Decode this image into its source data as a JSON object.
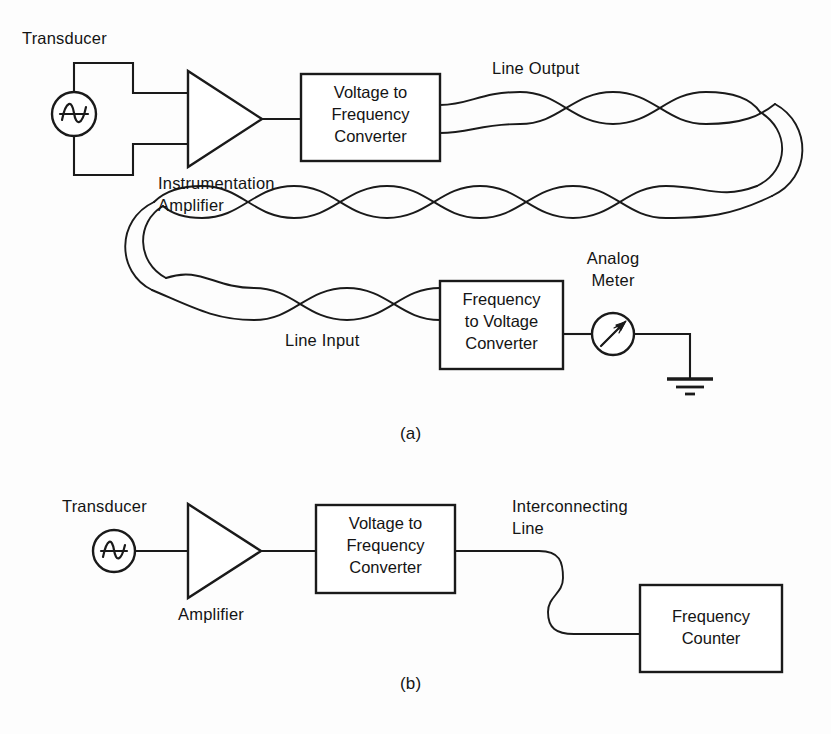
{
  "figure": {
    "type": "block-diagram",
    "background_color": "#fdfdfd",
    "line_color": "#1a1a1a"
  },
  "part_a": {
    "caption": "(a)",
    "transducer_label": "Transducer",
    "transducer_symbol": "ac-source-sine",
    "amplifier_label": "Instrumentation\nAmplifier",
    "amplifier_label_line1": "Instrumentation",
    "amplifier_label_line2": "Amplifier",
    "amplifier_symbol": "triangle-amplifier",
    "vfc_box": {
      "text": "Voltage to\nFrequency\nConverter",
      "line1": "Voltage to",
      "line2": "Frequency",
      "line3": "Converter"
    },
    "line_output_label": "Line Output",
    "line_input_label": "Line Input",
    "transmission_medium": "twisted-pair",
    "fvc_box": {
      "text": "Frequency\nto Voltage\nConverter",
      "line1": "Frequency",
      "line2": "to Voltage",
      "line3": "Converter"
    },
    "meter_label": "Analog\nMeter",
    "meter_label_line1": "Analog",
    "meter_label_line2": "Meter",
    "meter_symbol": "analog-meter-needle",
    "ground_symbol": "earth-ground"
  },
  "part_b": {
    "caption": "(b)",
    "transducer_label": "Transducer",
    "transducer_symbol": "ac-source-sine",
    "amplifier_label": "Amplifier",
    "amplifier_symbol": "triangle-amplifier",
    "vfc_box": {
      "text": "Voltage to\nFrequency\nConverter",
      "line1": "Voltage to",
      "line2": "Frequency",
      "line3": "Converter"
    },
    "interconnecting_line_label": "Interconnecting\nLine",
    "interconnecting_line_label_line1": "Interconnecting",
    "interconnecting_line_label_line2": "Line",
    "counter_box": {
      "text": "Frequency\nCounter",
      "line1": "Frequency",
      "line2": "Counter"
    }
  }
}
